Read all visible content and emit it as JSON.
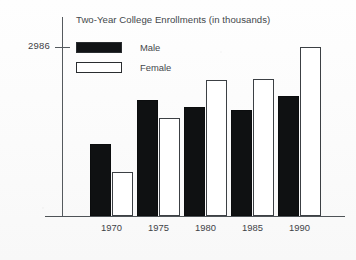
{
  "chart_data": {
    "type": "bar",
    "title": "Two-Year College Enrollments (in thousands)",
    "xlabel": "",
    "ylabel": "",
    "categories": [
      "1970",
      "1975",
      "1980",
      "1985",
      "1990"
    ],
    "series": [
      {
        "name": "Male",
        "color": "#0f1112",
        "values": [
          1270,
          2050,
          1930,
          1875,
          2120
        ]
      },
      {
        "name": "Female",
        "color": "#ffffff",
        "values": [
          780,
          1730,
          2400,
          2420,
          2986
        ]
      }
    ],
    "ytick_labels": [
      "2986"
    ],
    "ytick_values": [
      2986
    ],
    "ylim": [
      0,
      3520
    ],
    "grid": false,
    "legend_position": "top-left-inside"
  },
  "axis": {
    "y_tick_label": "2986"
  },
  "legend": {
    "items": [
      {
        "label": "Male",
        "swatch": "filled-black-rectangle"
      },
      {
        "label": "Female",
        "swatch": "outlined-white-rectangle"
      }
    ]
  }
}
